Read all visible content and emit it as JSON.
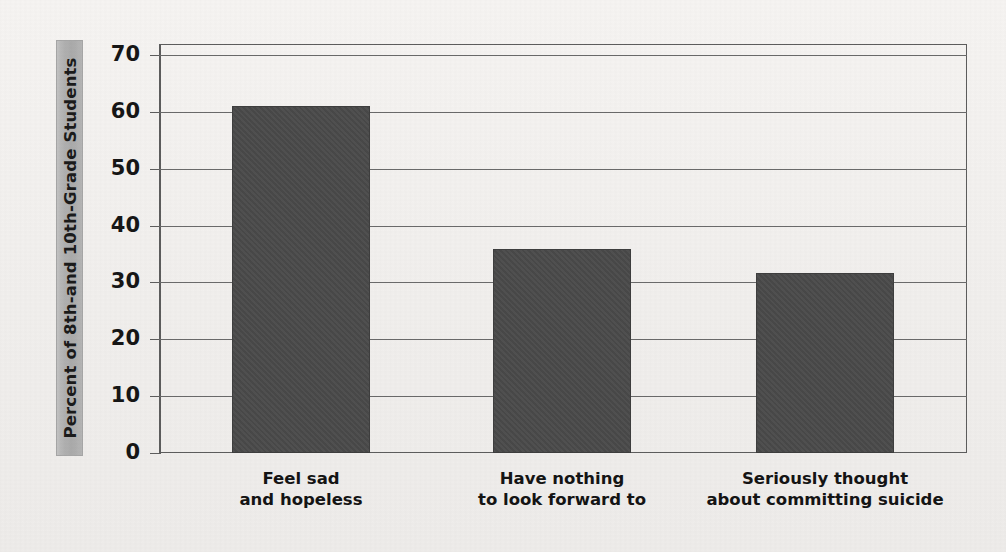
{
  "chart_data": {
    "type": "bar",
    "title": "",
    "subtitle": "",
    "xlabel": "",
    "ylabel": "Percent of 8th-and 10th-Grade Students",
    "categories": [
      "Feel sad\nand hopeless",
      "Have nothing\nto look forward to",
      "Seriously thought\nabout committing suicide"
    ],
    "values": [
      61,
      35.8,
      31.7
    ],
    "ylim": [
      0,
      70
    ],
    "ytick_labels": [
      "0",
      "10",
      "20",
      "30",
      "40",
      "50",
      "60",
      "70"
    ],
    "ytick_values": [
      0,
      10,
      20,
      30,
      40,
      50,
      60,
      70
    ],
    "grid": true,
    "legend": "none",
    "bar_color": "#4a4a4a",
    "axis_color": "#5d5d5d",
    "gridline_color": "#6a6a6a",
    "label_band_color": "#b2b2b2",
    "background_color": "#f2f0ee"
  },
  "axis": {
    "y_title": "Percent of 8th-and 10th-Grade Students"
  }
}
